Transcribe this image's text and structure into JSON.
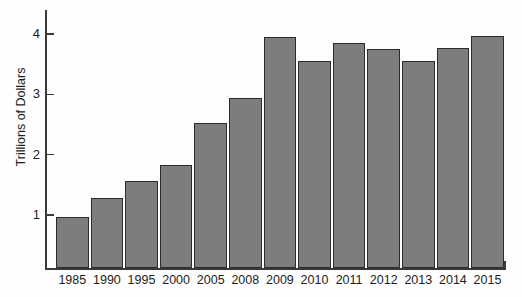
{
  "chart_data": {
    "type": "bar",
    "title": "",
    "xlabel": "",
    "ylabel": "Trillions of Dollars",
    "categories": [
      "1985",
      "1990",
      "1995",
      "2000",
      "2005",
      "2008",
      "2009",
      "2010",
      "2011",
      "2012",
      "2013",
      "2014",
      "2015"
    ],
    "values": [
      0.97,
      1.28,
      1.56,
      1.83,
      2.53,
      2.94,
      3.95,
      3.55,
      3.85,
      3.75,
      3.55,
      3.77,
      3.97
    ],
    "ylim": [
      0,
      4.3
    ],
    "y_ticks": [
      1,
      2,
      3,
      4
    ],
    "y_tick_labels": [
      "1",
      "2",
      "3",
      "4"
    ],
    "grid": false,
    "legend": null,
    "bar_color": "#7d7d7d",
    "bar_edge_color": "#2b2b2b",
    "axis_color": "#3a3a3a",
    "background_color": "#fefefe"
  },
  "axis": {
    "y_title": "Trillions of Dollars"
  }
}
